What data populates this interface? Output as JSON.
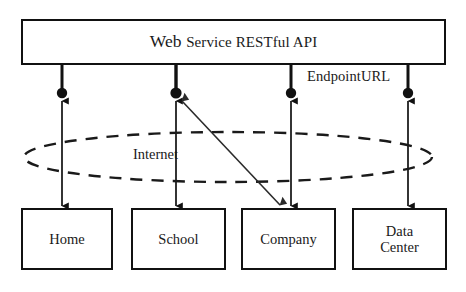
{
  "diagram": {
    "title": "Web Service RESTful API",
    "title_parts": {
      "lead": "Web ",
      "rest": "Service RESTful API"
    },
    "endpoint_label": "EndpointURL",
    "cloud_label": "Internet",
    "endpoints": [
      {
        "name": "endpoint-1",
        "x": 62
      },
      {
        "name": "endpoint-2",
        "x": 176
      },
      {
        "name": "endpoint-3",
        "x": 291
      },
      {
        "name": "endpoint-4",
        "x": 408
      }
    ],
    "clients": [
      {
        "id": "home",
        "label": "Home",
        "lines": [
          "Home"
        ]
      },
      {
        "id": "school",
        "label": "School",
        "lines": [
          "School"
        ]
      },
      {
        "id": "company",
        "label": "Company",
        "lines": [
          "Company"
        ]
      },
      {
        "id": "datacenter",
        "label": "Data Center",
        "lines": [
          "Data",
          "Center"
        ]
      }
    ],
    "colors": {
      "stroke": "#111111",
      "background": "#ffffff",
      "dashed_cloud": "#1a1a1a",
      "diagonal_link": "#2b2b2b"
    }
  }
}
